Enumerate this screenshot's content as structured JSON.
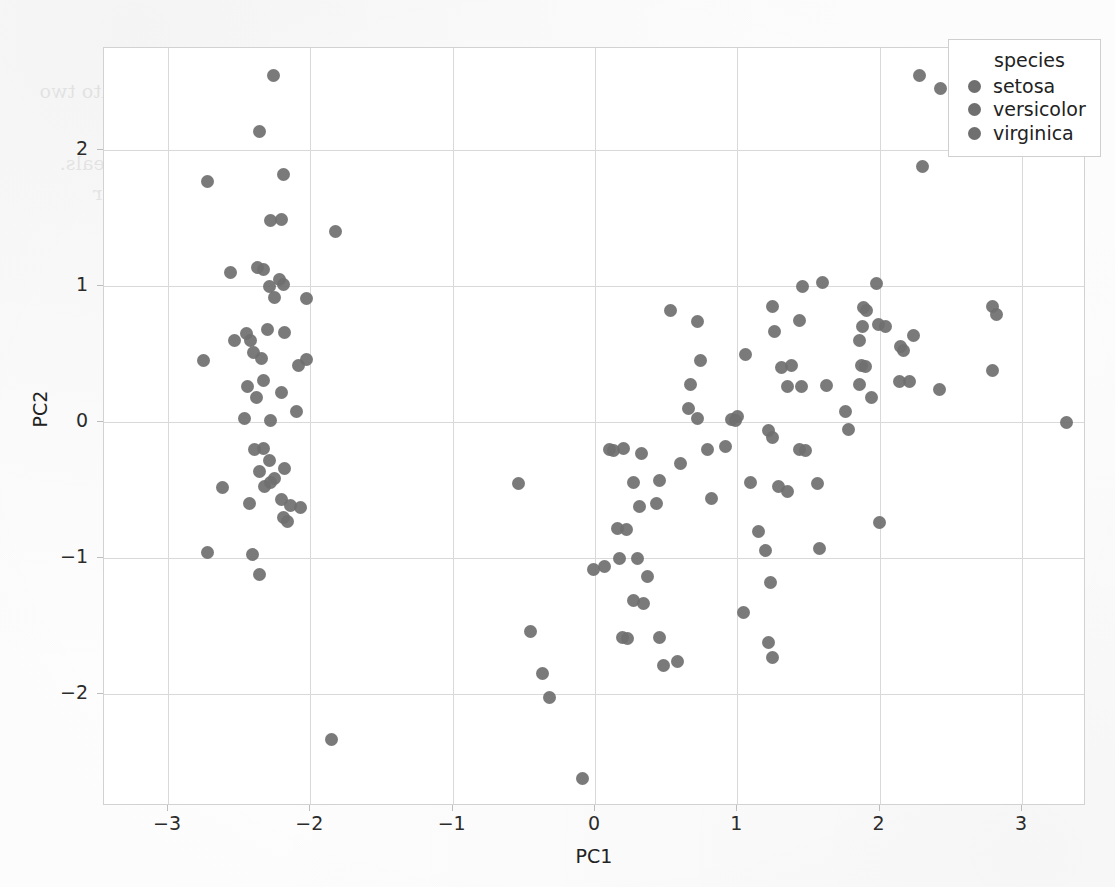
{
  "figure": {
    "xlabel": "PC1",
    "ylabel": "PC2",
    "point_color": "#6f6f6f",
    "grid_color": "#d9d9d9",
    "panel_border_color": "#d2d2d2"
  },
  "legend": {
    "title": "species",
    "entries": [
      {
        "label": "setosa",
        "color": "#6f6f6f"
      },
      {
        "label": "versicolor",
        "color": "#6f6f6f"
      },
      {
        "label": "virginica",
        "color": "#6f6f6f"
      }
    ]
  },
  "scan_ghost": {
    "lines": [
      "principal components chosen for plotting a 2D scatter plot of the data reduced",
      "2. Explain step by step how each column from the input matrix is used and combined into two",
      "output matrix",
      "3. Show how to interpret the resulting scatter plot and what structure it reveals.",
      "X axis and Y axis belong to principal components and explain the variance according to their",
      "values, the second column of the dataset.",
      "4. Name two uses or applications of PCA."
    ]
  },
  "chart_data": {
    "type": "scatter",
    "title": "",
    "xlabel": "PC1",
    "ylabel": "PC2",
    "xlim": [
      -3.45,
      3.45
    ],
    "ylim": [
      -2.82,
      2.75
    ],
    "xticks": [
      -3,
      -2,
      -1,
      0,
      1,
      2,
      3
    ],
    "yticks": [
      -2,
      -1,
      0,
      1,
      2
    ],
    "grid": true,
    "legend_position": "top-right",
    "marker": "circle",
    "marker_size": 13,
    "series": [
      {
        "name": "setosa",
        "color": "#6f6f6f",
        "points": [
          [
            -2.26,
            2.55
          ],
          [
            -2.36,
            2.14
          ],
          [
            -2.19,
            1.82
          ],
          [
            -2.72,
            1.77
          ],
          [
            -1.82,
            1.4
          ],
          [
            -2.28,
            1.48
          ],
          [
            -2.2,
            1.49
          ],
          [
            -2.33,
            1.12
          ],
          [
            -2.37,
            1.14
          ],
          [
            -2.56,
            1.1
          ],
          [
            -2.22,
            1.05
          ],
          [
            -2.29,
            1.0
          ],
          [
            -2.25,
            0.92
          ],
          [
            -2.19,
            1.01
          ],
          [
            -2.03,
            0.91
          ],
          [
            -2.45,
            0.65
          ],
          [
            -2.3,
            0.68
          ],
          [
            -2.18,
            0.66
          ],
          [
            -2.4,
            0.51
          ],
          [
            -2.34,
            0.47
          ],
          [
            -2.03,
            0.46
          ],
          [
            -2.08,
            0.42
          ],
          [
            -2.44,
            0.26
          ],
          [
            -2.33,
            0.31
          ],
          [
            -2.2,
            0.22
          ],
          [
            -2.1,
            0.08
          ],
          [
            -2.75,
            0.45
          ],
          [
            -2.53,
            0.6
          ],
          [
            -2.42,
            0.6
          ],
          [
            -2.38,
            0.18
          ],
          [
            -2.46,
            0.03
          ],
          [
            -2.28,
            0.01
          ],
          [
            -2.62,
            -0.48
          ],
          [
            -2.33,
            -0.19
          ],
          [
            -2.39,
            -0.2
          ],
          [
            -2.29,
            -0.28
          ],
          [
            -2.18,
            -0.34
          ],
          [
            -2.25,
            -0.41
          ],
          [
            -2.28,
            -0.44
          ],
          [
            -2.32,
            -0.47
          ],
          [
            -2.36,
            -0.36
          ],
          [
            -2.43,
            -0.6
          ],
          [
            -2.2,
            -0.57
          ],
          [
            -2.14,
            -0.61
          ],
          [
            -2.19,
            -0.7
          ],
          [
            -2.16,
            -0.73
          ],
          [
            -2.07,
            -0.63
          ],
          [
            -2.41,
            -0.97
          ],
          [
            -2.72,
            -0.96
          ],
          [
            -2.36,
            -1.12
          ],
          [
            -1.85,
            -2.33
          ]
        ]
      },
      {
        "name": "versicolor",
        "color": "#6f6f6f",
        "points": [
          [
            0.53,
            0.82
          ],
          [
            0.72,
            0.74
          ],
          [
            0.74,
            0.45
          ],
          [
            0.67,
            0.28
          ],
          [
            0.66,
            0.1
          ],
          [
            0.72,
            0.03
          ],
          [
            0.96,
            0.02
          ],
          [
            1.0,
            0.04
          ],
          [
            0.99,
            0.01
          ],
          [
            1.06,
            0.5
          ],
          [
            1.25,
            0.85
          ],
          [
            1.46,
            1.0
          ],
          [
            1.44,
            0.75
          ],
          [
            1.26,
            0.67
          ],
          [
            1.6,
            1.03
          ],
          [
            1.31,
            0.4
          ],
          [
            1.38,
            0.42
          ],
          [
            1.35,
            0.26
          ],
          [
            1.45,
            0.26
          ],
          [
            1.86,
            0.6
          ],
          [
            1.98,
            1.02
          ],
          [
            1.91,
            0.82
          ],
          [
            1.89,
            0.84
          ],
          [
            1.87,
            0.42
          ],
          [
            1.9,
            0.41
          ],
          [
            1.86,
            0.28
          ],
          [
            2.17,
            0.53
          ],
          [
            0.1,
            -0.2
          ],
          [
            0.13,
            -0.21
          ],
          [
            0.2,
            -0.19
          ],
          [
            0.33,
            -0.23
          ],
          [
            0.45,
            -0.43
          ],
          [
            0.6,
            -0.3
          ],
          [
            0.27,
            -0.44
          ],
          [
            0.16,
            -0.78
          ],
          [
            0.22,
            -0.79
          ],
          [
            0.31,
            -0.62
          ],
          [
            0.43,
            -0.6
          ],
          [
            0.17,
            -1.0
          ],
          [
            0.3,
            -1.0
          ],
          [
            0.07,
            -1.06
          ],
          [
            -0.01,
            -1.08
          ],
          [
            0.37,
            -1.13
          ],
          [
            0.27,
            -1.31
          ],
          [
            0.34,
            -1.33
          ],
          [
            0.19,
            -1.58
          ],
          [
            0.23,
            -1.59
          ],
          [
            0.45,
            -1.58
          ],
          [
            0.58,
            -1.76
          ],
          [
            0.48,
            -1.79
          ],
          [
            0.82,
            -0.56
          ],
          [
            0.92,
            -0.18
          ],
          [
            1.23,
            -1.18
          ],
          [
            1.04,
            -1.4
          ],
          [
            1.22,
            -1.62
          ],
          [
            1.25,
            -1.73
          ],
          [
            -0.45,
            -1.54
          ],
          [
            -0.37,
            -1.85
          ],
          [
            -0.32,
            -2.02
          ],
          [
            -0.09,
            -2.62
          ],
          [
            -0.54,
            -0.45
          ],
          [
            1.09,
            -0.44
          ],
          [
            1.29,
            -0.47
          ],
          [
            1.15,
            -0.8
          ],
          [
            1.2,
            -0.94
          ],
          [
            1.35,
            -0.51
          ],
          [
            1.56,
            -0.45
          ],
          [
            1.58,
            -0.93
          ],
          [
            1.22,
            -0.06
          ],
          [
            1.25,
            -0.11
          ],
          [
            1.44,
            -0.2
          ],
          [
            1.48,
            -0.21
          ],
          [
            2.0,
            -0.74
          ],
          [
            1.78,
            -0.05
          ],
          [
            0.79,
            -0.2
          ]
        ]
      },
      {
        "name": "virginica",
        "color": "#6f6f6f",
        "points": [
          [
            2.28,
            2.55
          ],
          [
            2.43,
            2.45
          ],
          [
            2.3,
            1.88
          ],
          [
            2.79,
            0.85
          ],
          [
            2.82,
            0.79
          ],
          [
            2.79,
            0.38
          ],
          [
            3.31,
            0.0
          ],
          [
            2.42,
            0.24
          ],
          [
            2.24,
            0.64
          ],
          [
            2.15,
            0.56
          ],
          [
            1.99,
            0.72
          ],
          [
            2.04,
            0.7
          ],
          [
            1.88,
            0.7
          ],
          [
            1.94,
            0.18
          ],
          [
            2.21,
            0.3
          ],
          [
            2.14,
            0.3
          ],
          [
            1.76,
            0.08
          ],
          [
            1.63,
            0.27
          ]
        ]
      }
    ]
  }
}
